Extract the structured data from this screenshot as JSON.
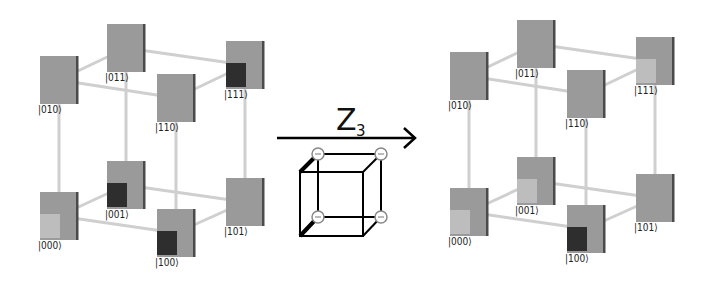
{
  "diagram": {
    "operation": {
      "label": "Z",
      "subscript": "3",
      "arrow_direction": "right"
    },
    "left_cube": {
      "name": "before",
      "states": [
        {
          "ket": "|000⟩",
          "marker": "light"
        },
        {
          "ket": "|001⟩",
          "marker": "dark"
        },
        {
          "ket": "|010⟩",
          "marker": "none"
        },
        {
          "ket": "|011⟩",
          "marker": "none"
        },
        {
          "ket": "|100⟩",
          "marker": "dark"
        },
        {
          "ket": "|101⟩",
          "marker": "none"
        },
        {
          "ket": "|110⟩",
          "marker": "none"
        },
        {
          "ket": "|111⟩",
          "marker": "dark"
        }
      ]
    },
    "right_cube": {
      "name": "after",
      "states": [
        {
          "ket": "|000⟩",
          "marker": "light"
        },
        {
          "ket": "|001⟩",
          "marker": "light"
        },
        {
          "ket": "|010⟩",
          "marker": "none"
        },
        {
          "ket": "|011⟩",
          "marker": "none"
        },
        {
          "ket": "|100⟩",
          "marker": "dark"
        },
        {
          "ket": "|101⟩",
          "marker": "none"
        },
        {
          "ket": "|110⟩",
          "marker": "none"
        },
        {
          "ket": "|111⟩",
          "marker": "light"
        }
      ]
    },
    "gate_icon": {
      "name": "cube-with-phase-nodes",
      "node_symbol": "−",
      "node_count": 4
    },
    "colors": {
      "panel": "#9a9a9a",
      "dark_marker": "#2e2e2e",
      "light_marker": "#bdbdbd",
      "edge": "#cfcfcf"
    }
  }
}
